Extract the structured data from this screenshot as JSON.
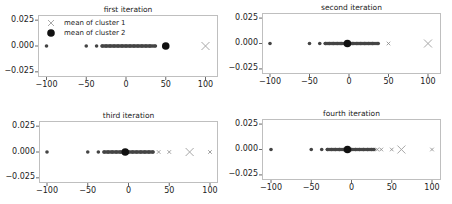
{
  "legend": {
    "items": [
      {
        "label": "mean of cluster 1",
        "marker": "x-icon",
        "color": "#a8a8a8"
      },
      {
        "label": "mean of cluster 2",
        "marker": "filled-circle-icon",
        "color": "#111111"
      }
    ]
  },
  "colors": {
    "points": "#444444",
    "cluster1_mean": "#a8a8a8",
    "cluster2_mean": "#111111",
    "frame": "#bfbfbf"
  },
  "axes": {
    "xticks": [
      "-100",
      "-50",
      "0",
      "50",
      "100"
    ],
    "yticks": [
      "0.025",
      "0.000",
      "−0.025"
    ]
  },
  "chart_data": [
    {
      "type": "scatter",
      "title": "first iteration",
      "xlabel": "",
      "ylabel": "",
      "xlim": [
        -105,
        105
      ],
      "ylim": [
        -0.03,
        0.03
      ],
      "xticks": [
        -100,
        -50,
        0,
        50,
        100
      ],
      "yticks": [
        0.025,
        0.0,
        -0.025
      ],
      "legend": [
        "mean of cluster 1",
        "mean of cluster 2"
      ],
      "legend_position": "upper left",
      "series": [
        {
          "name": "data points",
          "x": [
            -100,
            -50,
            -37,
            -30,
            -25,
            -20,
            -15,
            -10,
            -5,
            0,
            5,
            10,
            15,
            20,
            25,
            30,
            37
          ]
        },
        {
          "name": "cluster 1 points",
          "x": []
        },
        {
          "name": "mean of cluster 1",
          "x": [
            100
          ]
        },
        {
          "name": "mean of cluster 2",
          "x": [
            50
          ]
        }
      ]
    },
    {
      "type": "scatter",
      "title": "second iteration",
      "xlabel": "",
      "ylabel": "",
      "xlim": [
        -105,
        105
      ],
      "ylim": [
        -0.03,
        0.03
      ],
      "xticks": [
        -100,
        -50,
        0,
        50,
        100
      ],
      "yticks": [
        0.025,
        0.0,
        -0.025
      ],
      "series": [
        {
          "name": "data points",
          "x": [
            -100,
            -50,
            -37,
            -30,
            -25,
            -20,
            -15,
            -10,
            -5,
            0,
            5,
            10,
            15,
            20,
            25,
            30,
            37
          ]
        },
        {
          "name": "cluster 1 points",
          "x": [
            50
          ]
        },
        {
          "name": "mean of cluster 1",
          "x": [
            100
          ]
        },
        {
          "name": "mean of cluster 2",
          "x": [
            -2
          ]
        }
      ]
    },
    {
      "type": "scatter",
      "title": "third iteration",
      "xlabel": "",
      "ylabel": "",
      "xlim": [
        -105,
        105
      ],
      "ylim": [
        -0.03,
        0.03
      ],
      "xticks": [
        -100,
        -50,
        0,
        50,
        100
      ],
      "yticks": [
        0.025,
        0.0,
        -0.025
      ],
      "series": [
        {
          "name": "data points",
          "x": [
            -100,
            -50,
            -37,
            -30,
            -25,
            -20,
            -15,
            -10,
            -5,
            0,
            5,
            10,
            15,
            20,
            25,
            30
          ]
        },
        {
          "name": "cluster 1 points",
          "x": [
            37,
            50,
            100
          ]
        },
        {
          "name": "mean of cluster 1",
          "x": [
            75
          ]
        },
        {
          "name": "mean of cluster 2",
          "x": [
            -4
          ]
        }
      ]
    },
    {
      "type": "scatter",
      "title": "fourth iteration",
      "xlabel": "",
      "ylabel": "",
      "xlim": [
        -105,
        105
      ],
      "ylim": [
        -0.03,
        0.03
      ],
      "xticks": [
        -100,
        -50,
        0,
        50,
        100
      ],
      "yticks": [
        0.025,
        0.0,
        -0.025
      ],
      "series": [
        {
          "name": "data points",
          "x": [
            -100,
            -50,
            -37,
            -30,
            -25,
            -20,
            -15,
            -10,
            -5,
            0,
            5,
            10,
            15,
            20,
            25,
            28
          ]
        },
        {
          "name": "cluster 1 points",
          "x": [
            32,
            37,
            50,
            100
          ]
        },
        {
          "name": "mean of cluster 1",
          "x": [
            62
          ]
        },
        {
          "name": "mean of cluster 2",
          "x": [
            -5
          ]
        }
      ]
    }
  ]
}
